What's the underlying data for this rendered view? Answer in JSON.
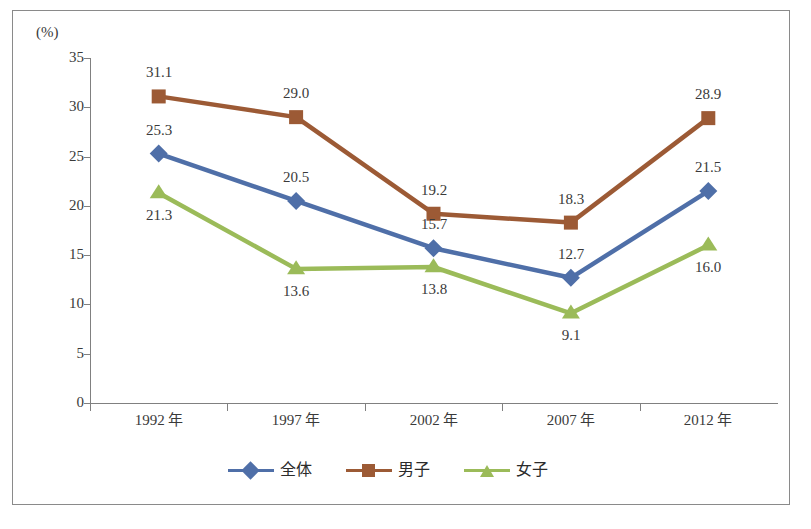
{
  "chart_data": {
    "type": "line",
    "title": "",
    "subtitle": "",
    "xlabel": "",
    "ylabel": "",
    "unit_label": "(%)",
    "categories": [
      "1992 年",
      "1997 年",
      "2002 年",
      "2007 年",
      "2012 年"
    ],
    "x_tick_labels": [
      "1992 年",
      "1997 年",
      "2002 年",
      "2007 年",
      "2012 年"
    ],
    "y_tick_labels": [
      "35",
      "30",
      "25",
      "20",
      "15",
      "10",
      "5",
      "0"
    ],
    "y_ticks": [
      35,
      30,
      25,
      20,
      15,
      10,
      5,
      0
    ],
    "ylim": [
      0,
      35
    ],
    "grid": false,
    "legend_position": "bottom",
    "series": [
      {
        "name": "全体",
        "color": "#4F6FA8",
        "marker": "diamond",
        "values": [
          25.3,
          20.5,
          15.7,
          12.7,
          21.5
        ],
        "labels": [
          "25.3",
          "20.5",
          "15.7",
          "12.7",
          "21.5"
        ],
        "label_positions": [
          "above",
          "above",
          "above",
          "above",
          "above"
        ]
      },
      {
        "name": "男子",
        "color": "#9C5A35",
        "marker": "square",
        "values": [
          31.1,
          29.0,
          19.2,
          18.3,
          28.9
        ],
        "labels": [
          "31.1",
          "29.0",
          "19.2",
          "18.3",
          "28.9"
        ],
        "label_positions": [
          "above",
          "above",
          "above",
          "above",
          "above"
        ]
      },
      {
        "name": "女子",
        "color": "#9BBB59",
        "marker": "triangle",
        "values": [
          21.3,
          13.6,
          13.8,
          9.1,
          16.0
        ],
        "labels": [
          "21.3",
          "13.6",
          "13.8",
          "9.1",
          "16.0"
        ],
        "label_positions": [
          "below",
          "below",
          "below",
          "below",
          "below"
        ]
      }
    ]
  },
  "legend": {
    "items": [
      {
        "label": "全体",
        "color": "#4F6FA8",
        "marker": "diamond"
      },
      {
        "label": "男子",
        "color": "#9C5A35",
        "marker": "square"
      },
      {
        "label": "女子",
        "color": "#9BBB59",
        "marker": "triangle"
      }
    ]
  },
  "colors": {
    "total": "#4F6FA8",
    "boys": "#9C5A35",
    "girls": "#9BBB59",
    "axis": "#808080",
    "text": "#3a3a3a",
    "frame": "#8a8a8a",
    "background": "#ffffff"
  }
}
